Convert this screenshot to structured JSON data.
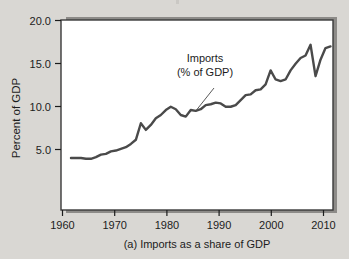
{
  "figure": {
    "caption": "(a) Imports as a share of GDP",
    "background_color": "#d9d7d3",
    "plot_background_color": "#ffffff",
    "frame_color": "#3a3a3a",
    "shadow_color": "#8d8b88",
    "line_color": "#4a4a4a",
    "text_color": "#1c1c1c"
  },
  "annotation": {
    "line1": "Imports",
    "line2": "(% of GDP)"
  },
  "axes": {
    "ylabel": "Percent of GDP",
    "xlabel": "",
    "y_ticks": [
      "5.0",
      "10.0",
      "15.0",
      "20.0"
    ],
    "x_ticks": [
      "1960",
      "1970",
      "1980",
      "1990",
      "2000",
      "2010"
    ]
  },
  "chart_data": {
    "type": "line",
    "title": "",
    "subtitle": "",
    "caption": "(a) Imports as a share of GDP",
    "xlabel": "",
    "ylabel": "Percent of GDP",
    "xlim": [
      1958,
      2012.5
    ],
    "ylim": [
      -2.0,
      21.0
    ],
    "xticks": [
      1960,
      1970,
      1980,
      1990,
      2000,
      2010
    ],
    "yticks": [
      5.0,
      10.0,
      15.0,
      20.0
    ],
    "ytick_labels": [
      "5.0",
      "10.0",
      "15.0",
      "20.0"
    ],
    "xtick_labels": [
      "1960",
      "1970",
      "1980",
      "1990",
      "2000",
      "2010"
    ],
    "grid": false,
    "legend": null,
    "annotations": [
      {
        "text": "Imports\n(% of GDP)",
        "x": 1986,
        "y": 14.2,
        "points_to_x": 1984.5,
        "points_to_y": 11.0
      }
    ],
    "series": [
      {
        "name": "Imports (% of GDP)",
        "color": "#4a4a4a",
        "x": [
          1960,
          1961,
          1962,
          1963,
          1964,
          1965,
          1966,
          1967,
          1968,
          1969,
          1970,
          1971,
          1972,
          1973,
          1974,
          1975,
          1976,
          1977,
          1978,
          1979,
          1980,
          1981,
          1982,
          1983,
          1984,
          1985,
          1986,
          1987,
          1988,
          1989,
          1990,
          1991,
          1992,
          1993,
          1994,
          1995,
          1996,
          1997,
          1998,
          1999,
          2000,
          2001,
          2002,
          2003,
          2004,
          2005,
          2006,
          2007,
          2008,
          2009,
          2010,
          2011,
          2012
        ],
        "values": [
          4.3,
          4.3,
          4.3,
          4.2,
          4.2,
          4.4,
          4.7,
          4.8,
          5.1,
          5.2,
          5.4,
          5.6,
          6.0,
          6.5,
          8.5,
          7.7,
          8.3,
          9.1,
          9.5,
          10.1,
          10.5,
          10.2,
          9.5,
          9.3,
          10.1,
          10.0,
          10.2,
          10.7,
          10.8,
          11.0,
          10.9,
          10.5,
          10.5,
          10.7,
          11.3,
          11.9,
          12.0,
          12.5,
          12.6,
          13.2,
          14.9,
          13.8,
          13.6,
          13.8,
          14.9,
          15.7,
          16.4,
          16.7,
          18.0,
          14.2,
          16.2,
          17.6,
          17.8
        ]
      }
    ]
  }
}
